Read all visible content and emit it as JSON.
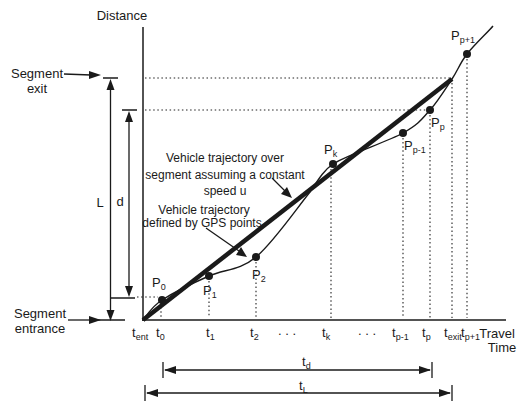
{
  "colors": {
    "ink": "#1a1a1a",
    "background": "#ffffff"
  },
  "axes": {
    "y_label": "Distance",
    "x_label_line1": "Travel",
    "x_label_line2": "Time"
  },
  "segment_markers": {
    "exit_line1": "Segment",
    "exit_line2": "exit",
    "entrance_line1": "Segment",
    "entrance_line2": "entrance"
  },
  "dimensions": {
    "segment_length": "L",
    "gps_distance": "d",
    "t_d": {
      "main": "t",
      "sub": "d"
    },
    "t_L": {
      "main": "t",
      "sub": "L"
    }
  },
  "annotations": {
    "constant_speed": {
      "line1": "Vehicle trajectory over",
      "line2": "segment assuming a constant",
      "line3": "speed u"
    },
    "gps": {
      "line1": "Vehicle trajectory",
      "line2": "defined by GPS points"
    }
  },
  "gps_points": {
    "p0": {
      "main": "P",
      "sub": "0"
    },
    "p1": {
      "main": "P",
      "sub": "1"
    },
    "p2": {
      "main": "P",
      "sub": "2"
    },
    "pk": {
      "main": "P",
      "sub": "k"
    },
    "pp1": {
      "main": "P",
      "sub": "p-1"
    },
    "pp": {
      "main": "P",
      "sub": "p"
    },
    "ppp1": {
      "main": "P",
      "sub": "p+1"
    }
  },
  "time_ticks": {
    "t_ent": {
      "main": "t",
      "sub": "ent"
    },
    "t_0": {
      "main": "t",
      "sub": "0"
    },
    "t_1": {
      "main": "t",
      "sub": "1"
    },
    "t_2": {
      "main": "t",
      "sub": "2"
    },
    "ellipsis1": ". . .",
    "t_k": {
      "main": "t",
      "sub": "k"
    },
    "ellipsis2": ". . .",
    "t_p1": {
      "main": "t",
      "sub": "p-1"
    },
    "t_p": {
      "main": "t",
      "sub": "p"
    },
    "t_exit": {
      "main": "t",
      "sub": "exit"
    },
    "t_pp1": {
      "main": "t",
      "sub": "p+1"
    }
  }
}
